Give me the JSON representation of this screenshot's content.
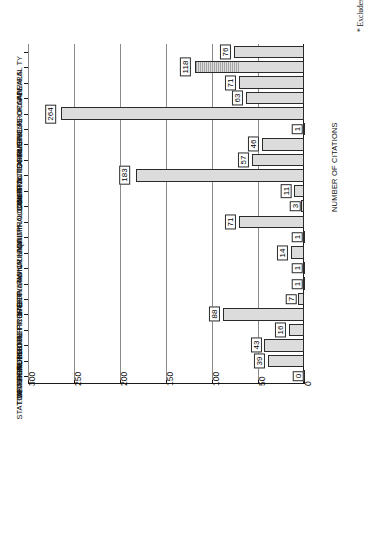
{
  "chart_data": {
    "type": "bar",
    "orientation": "horizontal",
    "title": "",
    "xlabel": "NUMBER OF CITATIONS",
    "ylabel": "",
    "xlim": [
      0,
      300
    ],
    "xticks": [
      0,
      50,
      100,
      150,
      200,
      250,
      300
    ],
    "grid": true,
    "legend": null,
    "annotations": [
      "* Excludes 788 misc. cases"
    ],
    "categories": [
      "ADMIRAL TY",
      "APPEALS",
      "BUSINESS ORGAN.",
      "CIVIL PROC.",
      "COMMERCIAL",
      "COMMON CARRIERS",
      "CONSTITUTIONAL",
      "CONTRACTS",
      "COURTS",
      "CRIMINAL LAW",
      "CRIMINAL PROC",
      "EQUITY",
      "FAMILY LAW",
      "INTERNATIONAL",
      "LABOR LAW",
      "PERSONAL PROPERTY",
      "PUBLIC OFFICERS",
      "REAL PROPERTY",
      "SECURITY INSTR.",
      "STAT. OF PERSONS",
      "TAXATION",
      "TORTS"
    ],
    "values": [
      76,
      118,
      71,
      63,
      264,
      1,
      46,
      57,
      183,
      11,
      3,
      71,
      1,
      14,
      1,
      1,
      7,
      88,
      16,
      43,
      39,
      0
    ]
  },
  "axis": {
    "value_axis_title": "NUMBER OF CITATIONS",
    "tick_labels": [
      "0",
      "50",
      "100",
      "150",
      "200",
      "250",
      "300"
    ]
  },
  "footnote": {
    "text": "* Excludes 788 misc. cases"
  }
}
